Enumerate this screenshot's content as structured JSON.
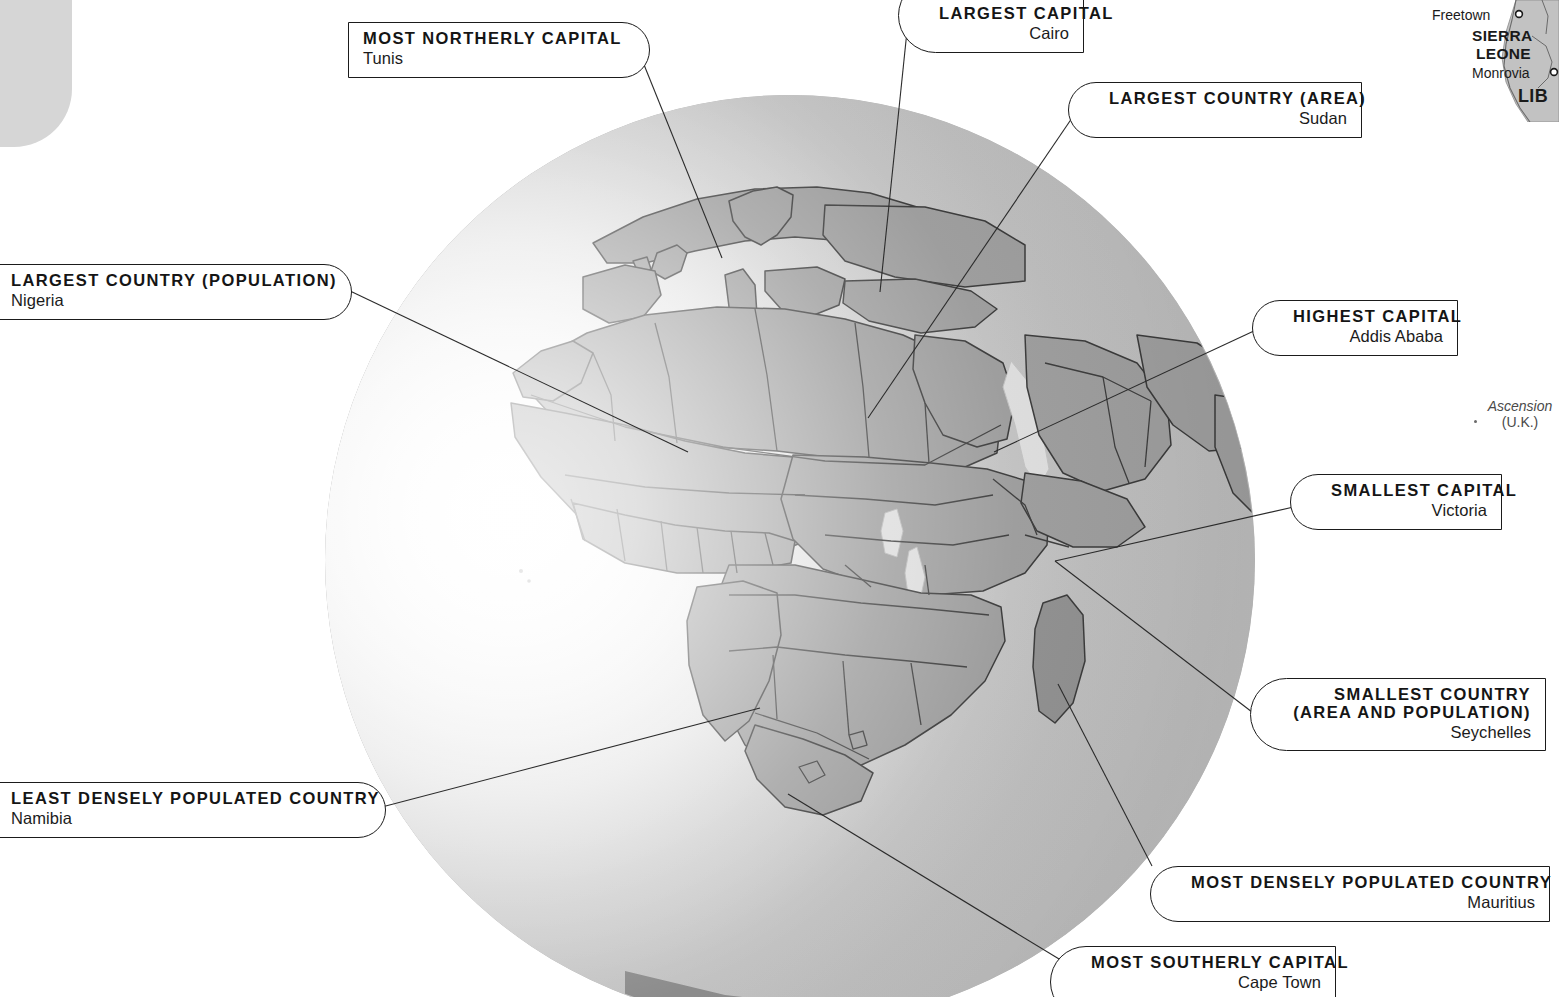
{
  "page": {
    "accent_line_color": "#2b2b2b",
    "box_border_color": "#1b1b1b",
    "globe_ocean_color": "#e9e9e9",
    "globe_land_color": "#9a9a9a"
  },
  "callouts": [
    {
      "id": "most-northerly-capital",
      "title": "MOST NORTHERLY CAPITAL",
      "value": "Tunis",
      "side": "left"
    },
    {
      "id": "largest-country-population",
      "title": "LARGEST COUNTRY (POPULATION)",
      "value": "Nigeria",
      "side": "left"
    },
    {
      "id": "least-densely-populated-country",
      "title": "LEAST DENSELY POPULATED COUNTRY",
      "value": "Namibia",
      "side": "left"
    },
    {
      "id": "largest-capital",
      "title": "LARGEST CAPITAL",
      "value": "Cairo",
      "side": "right"
    },
    {
      "id": "largest-country-area",
      "title": "LARGEST COUNTRY (AREA)",
      "value": "Sudan",
      "side": "right"
    },
    {
      "id": "highest-capital",
      "title": "HIGHEST CAPITAL",
      "value": "Addis Ababa",
      "side": "right"
    },
    {
      "id": "smallest-capital",
      "title": "SMALLEST CAPITAL",
      "value": "Victoria",
      "side": "right"
    },
    {
      "id": "smallest-country",
      "title_line1": "SMALLEST COUNTRY",
      "title_line2": "(AREA AND POPULATION)",
      "value": "Seychelles",
      "side": "right"
    },
    {
      "id": "most-densely-populated-country",
      "title": "MOST DENSELY POPULATED COUNTRY",
      "value": "Mauritius",
      "side": "right"
    },
    {
      "id": "most-southerly-capital",
      "title": "MOST SOUTHERLY CAPITAL",
      "value": "Cape Town",
      "side": "right"
    }
  ],
  "inset_map": {
    "city_freetown": "Freetown",
    "country_sierra_leone_line1": "SIERRA",
    "country_sierra_leone_line2": "LEONE",
    "city_monrovia": "Monrovia",
    "country_liberia_partial": "LIB"
  },
  "island_label": {
    "name": "Ascension",
    "sovereignty": "(U.K.)"
  }
}
